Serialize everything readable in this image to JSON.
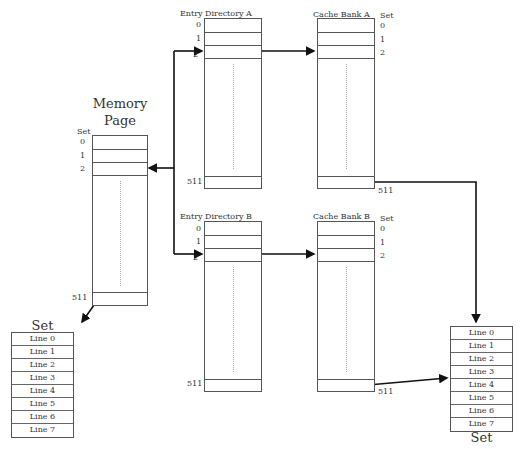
{
  "memory_page": {
    "title_line1": "Memory",
    "title_line2": "Page",
    "set_label": "Set",
    "indices": [
      "0",
      "1",
      "2",
      "511"
    ]
  },
  "entry_directory_a": {
    "title": "Entry Directory A",
    "indices": [
      "0",
      "1",
      "2",
      "511"
    ]
  },
  "entry_directory_b": {
    "title": "Entry Directory B",
    "indices": [
      "0",
      "1",
      "2",
      "511"
    ]
  },
  "cache_bank_a": {
    "title": "Cache Bank A",
    "set_label": "Set",
    "indices": [
      "0",
      "1",
      "2",
      "511"
    ]
  },
  "cache_bank_b": {
    "title": "Cache Bank B",
    "set_label": "Set",
    "indices": [
      "0",
      "1",
      "2",
      "511"
    ]
  },
  "left_set": {
    "title": "Set",
    "lines": [
      "Line 0",
      "Line 1",
      "Line 2",
      "Line 3",
      "Line 4",
      "Line 5",
      "Line 6",
      "Line 7"
    ]
  },
  "right_set": {
    "title": "Set",
    "lines": [
      "Line 0",
      "Line 1",
      "Line 2",
      "Line 3",
      "Line 4",
      "Line 5",
      "Line 6",
      "Line 7"
    ]
  }
}
